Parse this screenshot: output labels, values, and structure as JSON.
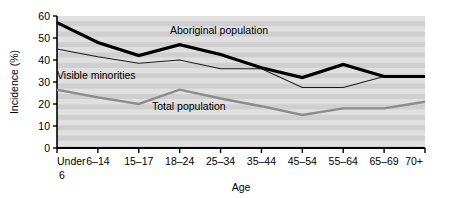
{
  "chart_data": {
    "type": "line",
    "title": "",
    "xlabel": "Age",
    "ylabel": "Incidence (%)",
    "categories": [
      "Under 6",
      "6–14",
      "15–17",
      "18–24",
      "25–34",
      "35–44",
      "45–54",
      "55–64",
      "65–69",
      "70+"
    ],
    "ylim": [
      0,
      60
    ],
    "yticks": [
      0,
      10,
      20,
      30,
      40,
      50,
      60
    ],
    "ytick_labels": [
      "0",
      "10",
      "20",
      "30",
      "40",
      "50",
      "60"
    ],
    "grid": false,
    "background_bands": true,
    "legend_position": "inline-annotations",
    "series": [
      {
        "name": "Aboriginal population",
        "values": [
          57,
          48,
          42,
          47,
          42.5,
          36.5,
          32,
          38,
          32.5,
          32.5
        ],
        "color": "#000000",
        "line_width": 3.2,
        "label_x": 170,
        "label_y": 34
      },
      {
        "name": "Visible minorities",
        "values": [
          45,
          41.5,
          38.5,
          40,
          36,
          36,
          27.5,
          27.5,
          32.5,
          32.5
        ],
        "color": "#1a1a1a",
        "line_width": 1.1,
        "label_x": 57,
        "label_y": 79
      },
      {
        "name": "Total population",
        "values": [
          26.5,
          23,
          20,
          26.5,
          22.5,
          19,
          15,
          18,
          18,
          21
        ],
        "color": "#8c8c8c",
        "line_width": 2.4,
        "label_x": 152,
        "label_y": 110
      }
    ]
  },
  "axes": {
    "y_axis_title": "Incidence (%)",
    "x_axis_title": "Age",
    "x_first_category_line1": "Under",
    "x_first_category_line2": "6"
  },
  "colors": {
    "plot_background": "#d9d9d9",
    "band_light": "#e0e0e0",
    "band_dark": "#cfcfcf",
    "axis": "#000000",
    "page_background": "#ffffff"
  }
}
